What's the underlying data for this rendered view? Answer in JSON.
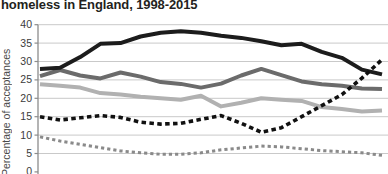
{
  "title": "homeless in England, 1998-2015",
  "chart_data": {
    "type": "line",
    "title": "homeless in England, 1998-2015",
    "xlabel": "",
    "ylabel": "Percentage of acceptances",
    "x": [
      1998,
      1999,
      2000,
      2001,
      2002,
      2003,
      2004,
      2005,
      2006,
      2007,
      2008,
      2009,
      2010,
      2011,
      2012,
      2013,
      2014,
      2015
    ],
    "x_tick_labels_visible": false,
    "ylim": [
      0,
      40
    ],
    "yticks": [
      40,
      35,
      30,
      25,
      20,
      15,
      10,
      5,
      0
    ],
    "grid": true,
    "legend_position": "none-visible",
    "gridline_color": "#c9c9c9",
    "axis_color": "#8c8c8c",
    "series": [
      {
        "name": "light-gray-solid",
        "color": "#b1b1b1",
        "style": "solid",
        "values": [
          23.8,
          23.4,
          22.9,
          21.4,
          21,
          20.4,
          20,
          19.6,
          20.7,
          17.8,
          18.8,
          20,
          19.6,
          19.3,
          17.6,
          17.1,
          16.4,
          16.7
        ]
      },
      {
        "name": "dark-gray-solid",
        "color": "#6b6b6b",
        "style": "solid",
        "values": [
          26,
          27.7,
          26.2,
          25.4,
          27,
          25.9,
          24.4,
          23.9,
          22.9,
          24,
          26.2,
          28,
          26.3,
          24.6,
          23.8,
          23.4,
          22.7,
          22.5
        ]
      },
      {
        "name": "gray-dashed",
        "color": "#8a8a8a",
        "style": "dashed",
        "values": [
          9.5,
          8.4,
          7.5,
          6.6,
          5.7,
          5.2,
          4.8,
          4.8,
          5.2,
          6,
          6.5,
          7,
          6.8,
          6.3,
          5.8,
          5.5,
          5.2,
          4.5
        ]
      },
      {
        "name": "black-solid",
        "color": "#1c1c1c",
        "style": "solid",
        "values": [
          28,
          28.3,
          31.2,
          34.8,
          35,
          36.8,
          37.8,
          38.2,
          37.8,
          37,
          36.4,
          35.5,
          34.4,
          34.8,
          32.6,
          31,
          27.8,
          26.5
        ]
      },
      {
        "name": "black-dashed",
        "color": "#111111",
        "style": "dashed",
        "values": [
          15,
          14.1,
          14.7,
          15.3,
          14.8,
          13.5,
          13,
          13.2,
          14.3,
          15.3,
          13.2,
          10.8,
          12,
          15,
          18,
          21,
          25.5,
          30.5
        ]
      }
    ]
  }
}
